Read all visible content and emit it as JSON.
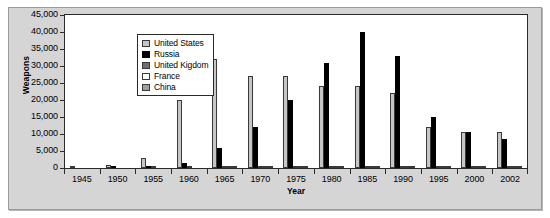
{
  "chart_data": {
    "type": "bar",
    "title": "",
    "xlabel": "Year",
    "ylabel": "Weapons",
    "ylim": [
      0,
      45000
    ],
    "yticks": [
      "45,000",
      "40,000",
      "35,000",
      "30,000",
      "25,000",
      "20,000",
      "15,000",
      "10,000",
      "5,000",
      "0"
    ],
    "ytick_values": [
      45000,
      40000,
      35000,
      30000,
      25000,
      20000,
      15000,
      10000,
      5000,
      0
    ],
    "grid": false,
    "legend_position": "top-left inside plot",
    "categories": [
      "1945",
      "1950",
      "1955",
      "1960",
      "1965",
      "1970",
      "1975",
      "1980",
      "1985",
      "1990",
      "1995",
      "2000",
      "2002"
    ],
    "series": [
      {
        "name": "United States",
        "color": "#c6c6c6",
        "values": [
          300,
          800,
          3000,
          20000,
          32000,
          27000,
          27000,
          24000,
          24000,
          22000,
          12000,
          10500,
          10500
        ]
      },
      {
        "name": "Russia",
        "color": "#000000",
        "values": [
          0,
          100,
          300,
          1600,
          6000,
          12000,
          20000,
          31000,
          40000,
          33000,
          15000,
          10500,
          8500
        ]
      },
      {
        "name": "United Kigdom",
        "color": "#6d6d6d",
        "values": [
          0,
          0,
          100,
          200,
          400,
          400,
          400,
          400,
          400,
          400,
          300,
          200,
          200
        ]
      },
      {
        "name": "France",
        "color": "#ffffff",
        "values": [
          0,
          0,
          0,
          0,
          100,
          200,
          300,
          300,
          400,
          500,
          500,
          450,
          350
        ]
      },
      {
        "name": "China",
        "color": "#a0a0a0",
        "values": [
          0,
          0,
          0,
          0,
          100,
          150,
          200,
          250,
          300,
          400,
          400,
          400,
          400
        ]
      }
    ]
  },
  "legend": {
    "items": [
      {
        "label": "United States",
        "key": "us"
      },
      {
        "label": "Russia",
        "key": "ru"
      },
      {
        "label": "United Kigdom",
        "key": "uk"
      },
      {
        "label": "France",
        "key": "fr"
      },
      {
        "label": "China",
        "key": "cn"
      }
    ]
  }
}
